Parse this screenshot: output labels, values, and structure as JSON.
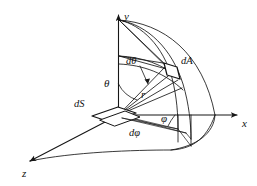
{
  "figure": {
    "background_color": "#ffffff",
    "stroke_color": "#161616",
    "axes": [
      {
        "name": "y-axis",
        "label": "y",
        "direction": "up",
        "label_x": 124,
        "label_y": 11
      },
      {
        "name": "x-axis",
        "label": "x",
        "direction": "right",
        "label_x": 242,
        "label_y": 120
      },
      {
        "name": "z-axis",
        "label": "z",
        "direction": "down-left",
        "label_x": 22,
        "label_y": 171
      }
    ],
    "labels": [
      {
        "name": "area-element-label",
        "text": "dA",
        "x": 181,
        "y": 60,
        "size": "diff"
      },
      {
        "name": "polar-differential-label",
        "text": "dθ",
        "x": 126,
        "y": 60,
        "size": "diff"
      },
      {
        "name": "polar-angle-label",
        "text": "θ",
        "x": 106,
        "y": 82,
        "size": "sym"
      },
      {
        "name": "radius-label",
        "text": "r",
        "x": 141,
        "y": 92,
        "size": "sym"
      },
      {
        "name": "surface-element-label",
        "text": "dS",
        "x": 76,
        "y": 102,
        "size": "diff"
      },
      {
        "name": "azimuth-angle-label",
        "text": "φ",
        "x": 163,
        "y": 116,
        "size": "sym"
      },
      {
        "name": "azimuth-differential-label",
        "text": "dφ",
        "x": 131,
        "y": 131,
        "size": "diff"
      }
    ],
    "geometry": {
      "origin": {
        "x": 118,
        "y": 115
      },
      "pole": {
        "x": 119,
        "y": 20
      },
      "radius": 97,
      "dA_patch_center": {
        "x": 170,
        "y": 71
      },
      "dS_patch_center": {
        "x": 113,
        "y": 117
      },
      "x_axis_end": {
        "x": 238,
        "y": 115
      },
      "z_axis_end": {
        "x": 26,
        "y": 163
      }
    }
  }
}
